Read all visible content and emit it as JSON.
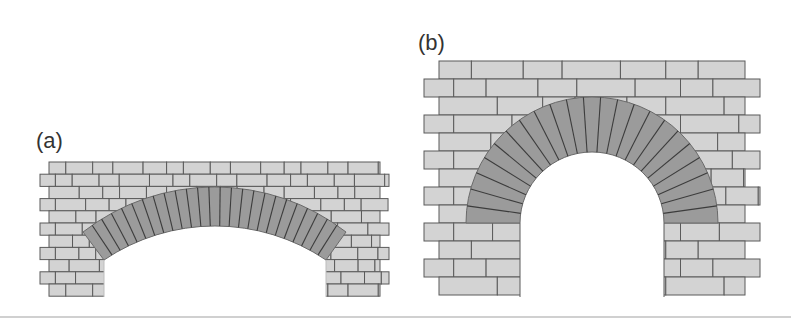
{
  "figure": {
    "panels": [
      {
        "id": "a",
        "label": "(a)",
        "type": "segmental-arch",
        "label_pos": [
          36,
          128
        ],
        "wall": {
          "x0": 40,
          "x1": 389,
          "y0": 162,
          "rows": 11,
          "row_h": 12.2,
          "indent": 9,
          "brick_w": 28
        },
        "arch": {
          "outer_left": [
            83,
            232
          ],
          "outer_top": [
            215,
            187
          ],
          "outer_right": [
            346,
            232
          ],
          "inner_left": [
            104,
            260
          ],
          "inner_top": [
            215,
            226
          ],
          "inner_right": [
            326,
            260
          ],
          "voussoirs": 25
        },
        "opening": {
          "x0": 104,
          "x1": 326,
          "y_bottom": 297
        }
      },
      {
        "id": "b",
        "label": "(b)",
        "type": "semicircular-arch",
        "label_pos": [
          418,
          30
        ],
        "wall": {
          "x0": 424,
          "x1": 760,
          "y0": 61,
          "rows": 13,
          "row_h": 18,
          "indent": 15,
          "brick_w": 54
        },
        "arch": {
          "center": [
            592,
            223
          ],
          "outer_r": 126,
          "inner_r": 72,
          "outer_ry": 126,
          "inner_ry": 71,
          "voussoirs": 23
        },
        "opening": {
          "x0": 520,
          "x1": 664,
          "y_bottom": 297
        }
      }
    ],
    "colors": {
      "brick": "#d3d3d3",
      "mortar": "#5a5a5a",
      "voussoir": "#9b9b9b",
      "voussoir_joint": "#3c3c3c",
      "background": "#ffffff"
    }
  }
}
